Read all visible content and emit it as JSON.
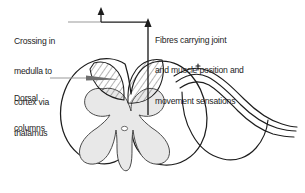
{
  "figure": {
    "background_color": "#ffffff",
    "ink_color": "#1d1d1d",
    "gray_matter_color": "#e8e8e8",
    "hatch_color": "#3a3a3a",
    "leader_color": "#8d8d8d"
  },
  "labels": {
    "crossing": {
      "name": "Crossing in medulla to cortex via thalamus",
      "lines": [
        "Crossing in",
        "medulla to",
        "cortex via",
        "thalamus"
      ]
    },
    "dorsal": {
      "name": "Dorsal columns",
      "lines": [
        "Dorsal",
        "columns"
      ]
    },
    "fibres": {
      "name": "Fibres carrying joint and muscle position and movement sensations",
      "lines": [
        "Fibres carrying joint",
        "and muscle position and",
        "movement sensations"
      ]
    }
  },
  "annotations": {
    "crossing_arrow": "vertical-up-arrow-from-horizontal-leader",
    "fibres_arrow": "vertical-up-arrow-from-cord-center",
    "dorsal_pointer": "tapered-wedge-pointer-into-hatched-column"
  },
  "anatomy": {
    "parts": [
      "cord-outline",
      "gray-matter-butterfly",
      "central-canal",
      "dorsal-column-left-hatched",
      "dorsal-column-right-hatched",
      "nerve-root-sheath-right"
    ]
  }
}
